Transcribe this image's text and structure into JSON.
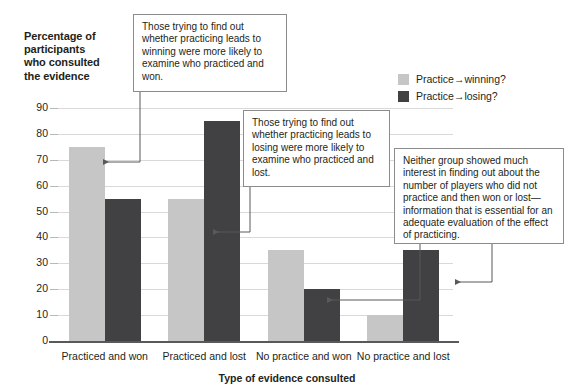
{
  "chart_data": {
    "type": "bar",
    "title": "",
    "ylabel": "Percentage of participants who consulted the evidence",
    "xlabel": "Type of evidence consulted",
    "categories": [
      "Practiced and won",
      "Practiced and lost",
      "No practice and won",
      "No practice and lost"
    ],
    "series": [
      {
        "name": "Practice→winning?",
        "color": "#c6c6c6",
        "values": [
          75,
          55,
          35,
          10
        ]
      },
      {
        "name": "Practice→losing?",
        "color": "#414042",
        "values": [
          55,
          85,
          20,
          35
        ]
      }
    ],
    "ylim": [
      0,
      90
    ],
    "ytick_step": 10,
    "yticks": [
      "0",
      "10",
      "20",
      "30",
      "40",
      "50",
      "60",
      "70",
      "80",
      "90"
    ],
    "grid": true,
    "legend_position": "top-right"
  },
  "axis": {
    "y_title_line1": "Percentage of",
    "y_title_line2": "participants",
    "y_title_line3": "who consulted",
    "y_title_line4": "the evidence",
    "x_title": "Type of evidence consulted"
  },
  "legend": {
    "items": [
      {
        "label": "Practice→winning?",
        "color": "#c6c6c6",
        "swatch": "light-gray-swatch"
      },
      {
        "label": "Practice→losing?",
        "color": "#414042",
        "swatch": "dark-gray-swatch"
      }
    ]
  },
  "annotations": [
    {
      "id": "callout-practiced-and-won",
      "text": "Those trying to find out whether practicing leads to winning were more likely to examine who practiced and won.",
      "points_to": "Practiced and won — Practice→winning? bar"
    },
    {
      "id": "callout-practiced-and-lost",
      "text": "Those trying to find out whether practicing leads to losing were more likely to examine who practiced and lost.",
      "points_to": "Practiced and lost — Practice→losing? bar"
    },
    {
      "id": "callout-no-practice",
      "text": "Neither group showed much interest in finding out about the number of players who did not practice and then won or lost—information that is essential for an adequate evaluation of the effect of practicing.",
      "points_to": "No practice and won / No practice and lost bars"
    }
  ]
}
